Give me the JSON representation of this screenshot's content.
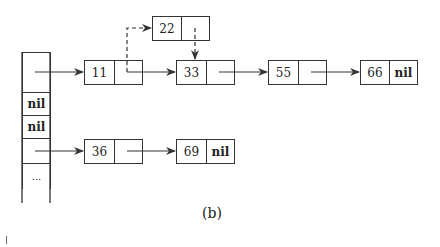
{
  "caption": "(b)",
  "array": {
    "cells": [
      {
        "label": "",
        "type": "pointer"
      },
      {
        "label": "nil",
        "type": "nil"
      },
      {
        "label": "nil",
        "type": "nil"
      },
      {
        "label": "",
        "type": "pointer"
      },
      {
        "label": "...",
        "type": "ellipsis"
      }
    ]
  },
  "nodes": {
    "n11": {
      "key": "11",
      "next": ""
    },
    "n22": {
      "key": "22",
      "next": ""
    },
    "n33": {
      "key": "33",
      "next": ""
    },
    "n55": {
      "key": "55",
      "next": ""
    },
    "n66": {
      "key": "66",
      "next": "nil"
    },
    "n36": {
      "key": "36",
      "next": ""
    },
    "n69": {
      "key": "69",
      "next": "nil"
    }
  },
  "edges": [
    {
      "from": "array[0]",
      "to": "11",
      "style": "solid"
    },
    {
      "from": "11",
      "to": "33",
      "style": "solid"
    },
    {
      "from": "11",
      "to": "22",
      "style": "dashed"
    },
    {
      "from": "22",
      "to": "33",
      "style": "dashed"
    },
    {
      "from": "33",
      "to": "55",
      "style": "solid"
    },
    {
      "from": "55",
      "to": "66",
      "style": "solid"
    },
    {
      "from": "array[3]",
      "to": "36",
      "style": "solid"
    },
    {
      "from": "36",
      "to": "69",
      "style": "solid"
    }
  ]
}
